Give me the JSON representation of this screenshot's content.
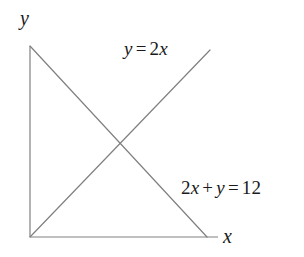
{
  "figure": {
    "width": 304,
    "height": 257,
    "background_color": "#ffffff",
    "line_color": "#808080",
    "text_color": "#1a1a1a",
    "axis_color": "#808080"
  },
  "axes": {
    "y_axis_label": "y",
    "x_axis_label": "x",
    "origin": {
      "x": 30,
      "y": 237
    },
    "y_axis": {
      "x1": 30,
      "y1": 46,
      "x2": 30,
      "y2": 237
    },
    "x_axis": {
      "x1": 30,
      "y1": 237,
      "x2": 218,
      "y2": 237
    },
    "ticks": [],
    "grid": false
  },
  "chart_data": {
    "type": "line",
    "title": "",
    "xlabel": "x",
    "ylabel": "y",
    "grid": false,
    "legend": "inline-annotations",
    "xlim": [
      0,
      12
    ],
    "ylim": [
      0,
      12
    ],
    "series": [
      {
        "name": "y = 2x",
        "equation": "y = 2x",
        "slope": 2,
        "intercept": 0,
        "x": [
          0,
          6
        ],
        "values": [
          0,
          12
        ],
        "pixel_start": {
          "x": 30,
          "y": 237
        },
        "pixel_end": {
          "x": 210,
          "y": 50
        },
        "color": "#808080"
      },
      {
        "name": "2x + y = 12",
        "equation": "2x + y = 12",
        "slope": -2,
        "intercept": 12,
        "x": [
          0,
          6
        ],
        "values": [
          12,
          0
        ],
        "pixel_start": {
          "x": 30,
          "y": 46
        },
        "pixel_end": {
          "x": 207,
          "y": 237
        },
        "color": "#808080"
      }
    ],
    "annotations": [
      {
        "text": "y = 2x",
        "parts": {
          "lhs": "y",
          "op": "=",
          "coef": "2",
          "var": "x"
        },
        "x": 124,
        "y": 39
      },
      {
        "text": "2x + y = 12",
        "parts": {
          "coef": "2",
          "var1": "x",
          "plus": "+",
          "var2": "y",
          "eq": "=",
          "rhs": "12"
        },
        "x": 181,
        "y": 178
      }
    ],
    "intersection": {
      "x": 3,
      "y": 6,
      "pixel": {
        "x": 115,
        "y": 143
      }
    }
  }
}
